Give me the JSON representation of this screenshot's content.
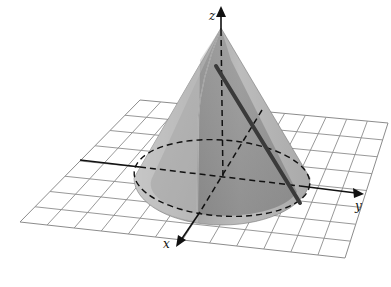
{
  "diagram": {
    "type": "3d-cone-on-coordinate-grid",
    "axes": [
      {
        "name": "x",
        "label": "x"
      },
      {
        "name": "y",
        "label": "y"
      },
      {
        "name": "z",
        "label": "z"
      }
    ],
    "shapes": [
      {
        "name": "cone",
        "description": "right circular cone with apex on z-axis, base in xy-plane"
      },
      {
        "name": "base-ellipse",
        "style": "dashed"
      },
      {
        "name": "slant-line",
        "style": "solid-dark"
      },
      {
        "name": "grid-plane",
        "description": "xy-plane grid"
      }
    ],
    "colors": {
      "cone_light": "#bdbdbd",
      "cone_dark": "#7a7a7a",
      "grid_line": "#8c8c8c",
      "axis": "#111111",
      "background": "#ffffff"
    }
  }
}
